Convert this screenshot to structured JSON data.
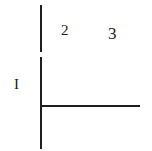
{
  "diagram": {
    "labels": {
      "region_1": "I",
      "region_2": "2",
      "region_3": "3"
    },
    "lines": [
      {
        "name": "vertical-axis-upper",
        "orientation": "vertical"
      },
      {
        "name": "vertical-axis-lower",
        "orientation": "vertical"
      },
      {
        "name": "horizontal-axis",
        "orientation": "horizontal"
      }
    ],
    "colors": {
      "line": "#1e1e1e",
      "text": "#1a1a1a",
      "background": "#ffffff"
    }
  }
}
